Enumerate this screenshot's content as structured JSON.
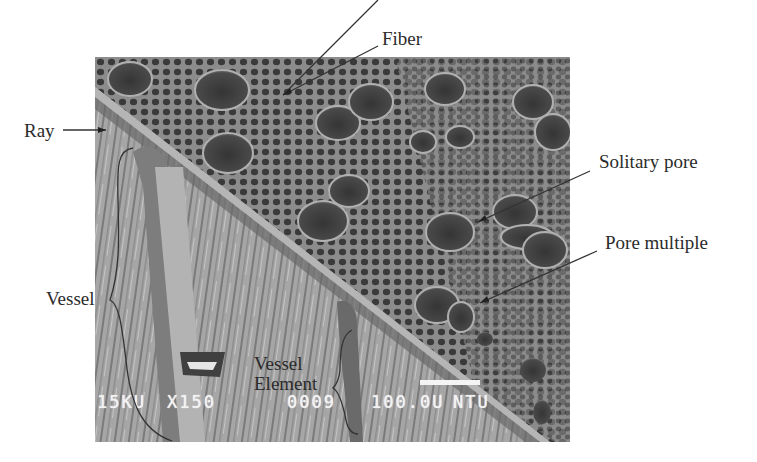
{
  "figure": {
    "type": "SEM micrograph of hardwood cross-section with annotated anatomy labels",
    "labels": {
      "fiber": "Fiber",
      "ray": "Ray",
      "solitary_pore": "Solitary pore",
      "pore_multiple": "Pore multiple",
      "vessel": "Vessel",
      "vessel_element_line1": "Vessel",
      "vessel_element_line2": "Element"
    },
    "sem_info": {
      "voltage": "15KU",
      "magnification": "X150",
      "frame": "0009",
      "scale": "100.0U",
      "lab": "NTU"
    },
    "colors": {
      "background": "#ffffff",
      "label_text": "#2b2b2b",
      "leader_line": "#333333",
      "sem_overlay_text": "#f2f2f2",
      "transverse_surface": "#6e6e6e",
      "longitudinal_surface": "#a9a9a9",
      "pore": "#3e3e3e"
    }
  }
}
